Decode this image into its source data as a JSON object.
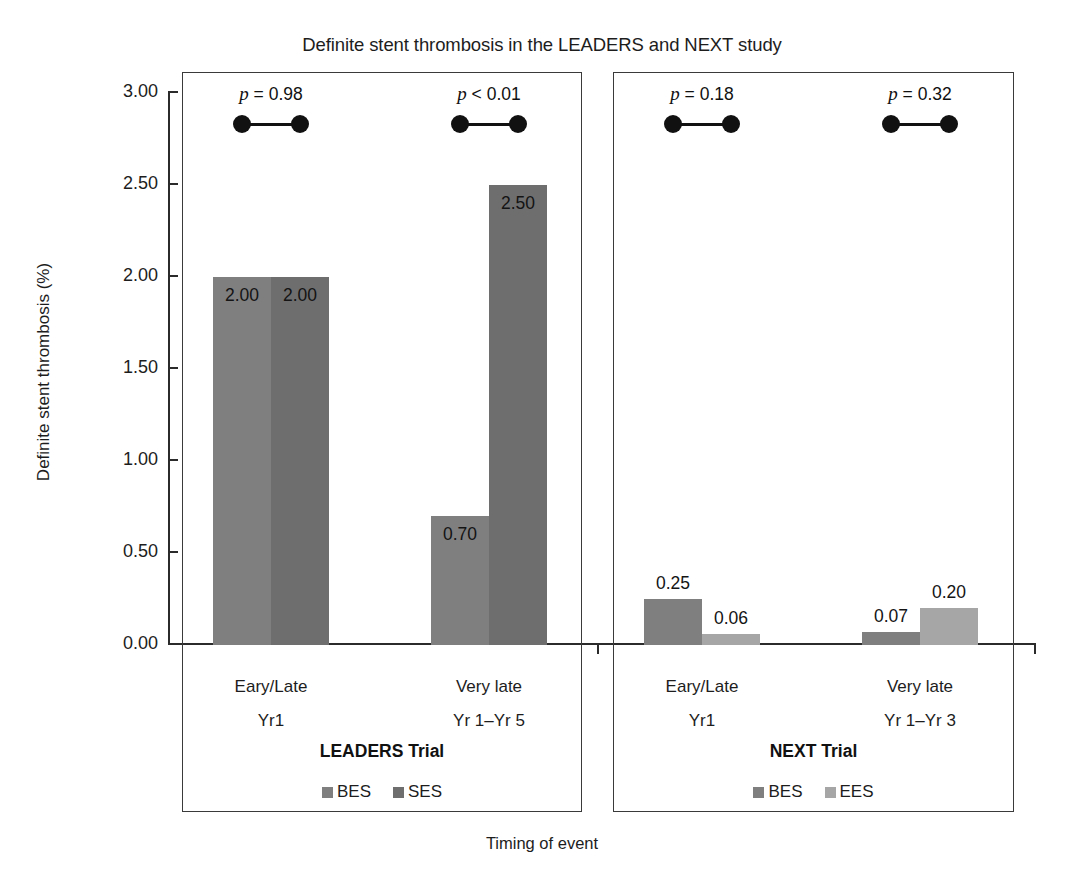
{
  "chart_data": {
    "type": "bar",
    "title": "Definite stent thrombosis in the LEADERS and NEXT study",
    "xlabel": "Timing of event",
    "ylabel": "Definite stent thrombosis (%)",
    "ylim": [
      0,
      3.0
    ],
    "ytick_labels": [
      "0.00",
      "0.50",
      "1.00",
      "1.50",
      "2.00",
      "2.50",
      "3.00"
    ],
    "ytick_values": [
      0,
      0.5,
      1.0,
      1.5,
      2.0,
      2.5,
      3.0
    ],
    "grid": false,
    "legend_position": "bottom-inside-panel",
    "panels": [
      {
        "name": "LEADERS Trial",
        "legend": [
          {
            "label": "BES",
            "color": "#7f7f7f"
          },
          {
            "label": "SES",
            "color": "#6e6e6e"
          }
        ],
        "categories": [
          {
            "line1": "Eary/Late",
            "line2": "Yr1"
          },
          {
            "line1": "Very late",
            "line2": "Yr 1–Yr 5"
          }
        ],
        "series": [
          {
            "name": "BES",
            "values": [
              2.0,
              0.7
            ],
            "labels": [
              "2.00",
              "0.70"
            ]
          },
          {
            "name": "SES",
            "values": [
              2.0,
              2.5
            ],
            "labels": [
              "2.00",
              "2.50"
            ]
          }
        ],
        "annotations": [
          {
            "text": "p = 0.98",
            "p_symbol": "p",
            "p_rest": " = 0.98",
            "group": 0
          },
          {
            "text": "p < 0.01",
            "p_symbol": "p",
            "p_rest": " < 0.01",
            "group": 1
          }
        ]
      },
      {
        "name": "NEXT Trial",
        "legend": [
          {
            "label": "BES",
            "color": "#7f7f7f"
          },
          {
            "label": "EES",
            "color": "#a6a6a6"
          }
        ],
        "categories": [
          {
            "line1": "Eary/Late",
            "line2": "Yr1"
          },
          {
            "line1": "Very late",
            "line2": "Yr 1–Yr 3"
          }
        ],
        "series": [
          {
            "name": "BES",
            "values": [
              0.25,
              0.07
            ],
            "labels": [
              "0.25",
              "0.07"
            ]
          },
          {
            "name": "EES",
            "values": [
              0.06,
              0.2
            ],
            "labels": [
              "0.06",
              "0.20"
            ]
          }
        ],
        "annotations": [
          {
            "text": "p = 0.18",
            "p_symbol": "p",
            "p_rest": " = 0.18",
            "group": 0
          },
          {
            "text": "p = 0.32",
            "p_symbol": "p",
            "p_rest": " = 0.32",
            "group": 1
          }
        ]
      }
    ],
    "colors": {
      "bar_dark": "#7f7f7f",
      "bar_mid": "#6e6e6e",
      "bar_light": "#a6a6a6",
      "axis": "#2b2b2b",
      "text": "#1d1d1d",
      "annotation": "#111111"
    }
  }
}
